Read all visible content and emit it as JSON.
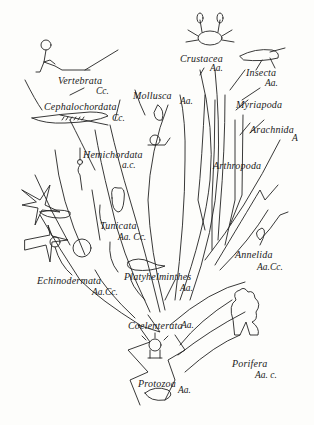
{
  "diagram": {
    "type": "phylogenetic-tree",
    "taxa": [
      {
        "name": "Vertebrata",
        "code": "Cc."
      },
      {
        "name": "Cephalochordata",
        "code": "Cc."
      },
      {
        "name": "Hemichordata",
        "code": "a.c."
      },
      {
        "name": "Tunicata",
        "code": "Aa. Cc."
      },
      {
        "name": "Echinodermata",
        "code": "Aa.Cc."
      },
      {
        "name": "Platyhelminthes",
        "code": "Aa."
      },
      {
        "name": "Coelenterata",
        "code": "Aa."
      },
      {
        "name": "Protozoa",
        "code": "Aa."
      },
      {
        "name": "Porifera",
        "code": "Aa. c."
      },
      {
        "name": "Mollusca",
        "code": "Aa."
      },
      {
        "name": "Crustacea",
        "code": "Aa."
      },
      {
        "name": "Insecta",
        "code": "Aa."
      },
      {
        "name": "Myriapoda",
        "code": ""
      },
      {
        "name": "Arachnida",
        "code": "A"
      },
      {
        "name": "Arthropoda",
        "code": ""
      },
      {
        "name": "Annelida",
        "code": "Aa.Cc."
      }
    ]
  }
}
